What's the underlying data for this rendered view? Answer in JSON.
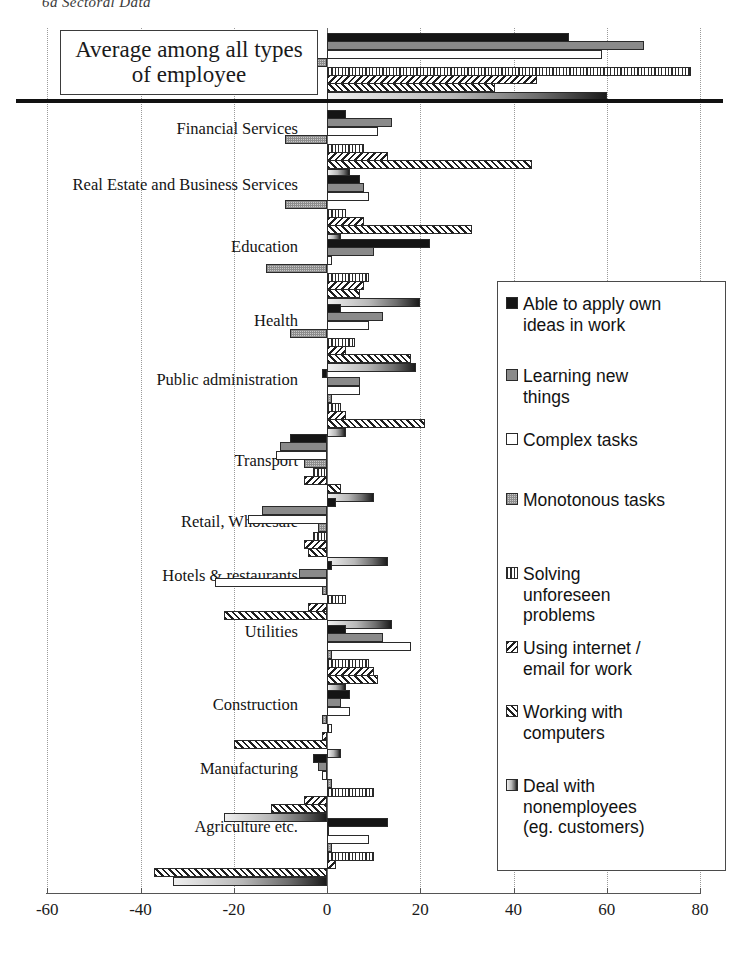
{
  "page": {
    "caption": "6a Sectoral Data"
  },
  "callout": {
    "text": "Average among all\ntypes of employee"
  },
  "legend": {
    "items": [
      {
        "label": "Able to apply own\nideas in work",
        "key": "solid-black-key"
      },
      {
        "label": "Learning new\nthings",
        "key": "mid-grey-key"
      },
      {
        "label": "Complex tasks",
        "key": "white-key"
      },
      {
        "label": "Monotonous tasks",
        "key": "fine-grid-key"
      },
      {
        "label": "Solving\nunforeseen\nproblems",
        "key": "horizontal-stripe-key"
      },
      {
        "label": "Using internet /\nemail for work",
        "key": "back-hatch-key"
      },
      {
        "label": "Working with\ncomputers",
        "key": "forward-hatch-key"
      },
      {
        "label": "Deal with\nnonemployees\n(eg. customers)",
        "key": "gradient-key"
      }
    ]
  },
  "chart_data": {
    "type": "bar",
    "orientation": "horizontal",
    "title": "6a Sectoral Data",
    "xlabel": "",
    "ylabel": "",
    "xlim": [
      -60,
      80
    ],
    "xticks": [
      -60,
      -40,
      -20,
      0,
      20,
      40,
      60,
      80
    ],
    "xtick_labels": [
      "-60",
      "-40",
      "-20",
      "0",
      "20",
      "40",
      "60",
      "80"
    ],
    "grid": true,
    "legend_position": "right",
    "series_names": [
      "Able to apply own ideas in work",
      "Learning new things",
      "Complex tasks",
      "Monotonous tasks",
      "Solving unforeseen problems",
      "Using internet / email for work",
      "Working with computers",
      "Deal with nonemployees (eg. customers)"
    ],
    "categories": [
      "Average among all types of employee",
      "Financial Services",
      "Real Estate and Business Services",
      "Education",
      "Health",
      "Public administration",
      "Transport",
      "Retail, Wholesale",
      "Hotels & restaurants",
      "Utilities",
      "Construction",
      "Manufacturing",
      "Agriculture etc."
    ],
    "series": [
      {
        "name": "Able to apply own ideas in work",
        "values": [
          52,
          4,
          7,
          22,
          3,
          -1,
          -8,
          2,
          1,
          4,
          5,
          -3,
          13
        ]
      },
      {
        "name": "Learning new things",
        "values": [
          68,
          14,
          8,
          10,
          12,
          7,
          -10,
          -14,
          -6,
          12,
          3,
          -2,
          0
        ]
      },
      {
        "name": "Complex tasks",
        "values": [
          59,
          11,
          9,
          1,
          9,
          7,
          -11,
          -17,
          -24,
          18,
          5,
          -1,
          9
        ]
      },
      {
        "name": "Monotonous tasks",
        "values": [
          -35,
          -9,
          -9,
          -13,
          -8,
          1,
          -5,
          -2,
          -1,
          1,
          -1,
          1,
          1
        ]
      },
      {
        "name": "Solving unforeseen problems",
        "values": [
          78,
          8,
          4,
          9,
          6,
          3,
          -3,
          -3,
          4,
          9,
          1,
          10,
          10
        ]
      },
      {
        "name": "Using internet / email for work",
        "values": [
          45,
          13,
          8,
          8,
          4,
          4,
          -5,
          -5,
          -4,
          10,
          -1,
          -5,
          2
        ]
      },
      {
        "name": "Working with computers",
        "values": [
          36,
          44,
          31,
          7,
          18,
          21,
          3,
          -4,
          -22,
          11,
          -20,
          -12,
          -37
        ]
      },
      {
        "name": "Deal with nonemployees (eg. customers)",
        "values": [
          60,
          5,
          3,
          20,
          19,
          4,
          10,
          13,
          14,
          4,
          3,
          -22,
          -33
        ]
      }
    ]
  }
}
